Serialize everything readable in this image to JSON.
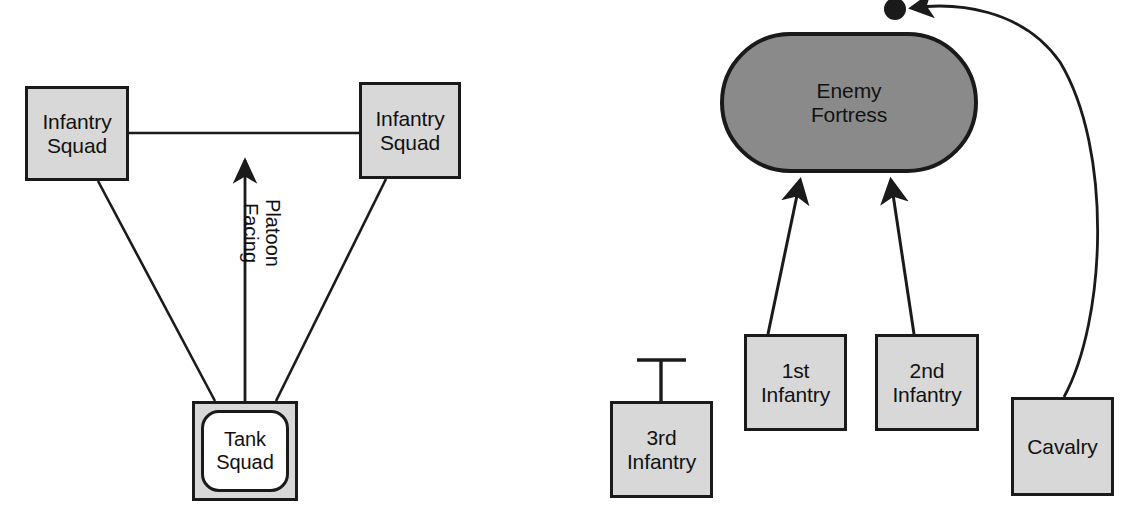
{
  "figure": {
    "background_color": "#ffffff",
    "line_color": "#1a1a1a",
    "box_fill": "#d8d8d8",
    "fortress_fill": "#8a8a8a",
    "text_color": "#111111"
  },
  "left_diagram": {
    "name": "platoon-formation-diagram",
    "nodes": {
      "infantry_squad_left": "Infantry\nSquad",
      "infantry_squad_right": "Infantry\nSquad",
      "tank_squad": "Tank\nSquad"
    },
    "annotations": {
      "platoon_facing": "Platoon\nFacing"
    },
    "connectors": [
      {
        "from": "infantry_squad_left",
        "to": "infantry_squad_right",
        "style": "line"
      },
      {
        "from": "infantry_squad_left",
        "to": "tank_squad",
        "style": "line"
      },
      {
        "from": "infantry_squad_right",
        "to": "tank_squad",
        "style": "line"
      },
      {
        "from": "tank_squad",
        "to": "platoon_facing",
        "style": "arrow-up"
      }
    ]
  },
  "right_diagram": {
    "name": "assault-plan-diagram",
    "nodes": {
      "enemy_fortress": "Enemy\nFortress",
      "first_infantry": "1st\nInfantry",
      "second_infantry": "2nd\nInfantry",
      "third_infantry": "3rd\nInfantry",
      "cavalry": "Cavalry"
    },
    "symbols": {
      "reserve_marker": "T-bar",
      "objective_marker": "filled-dot"
    },
    "connectors": [
      {
        "from": "first_infantry",
        "to": "enemy_fortress",
        "style": "arrow-attack"
      },
      {
        "from": "second_infantry",
        "to": "enemy_fortress",
        "style": "arrow-attack"
      },
      {
        "from": "cavalry",
        "to": "objective_marker",
        "style": "curved-arrow-envelop"
      },
      {
        "from": "third_infantry",
        "to": "reserve_marker",
        "style": "stem-tbar"
      }
    ]
  }
}
